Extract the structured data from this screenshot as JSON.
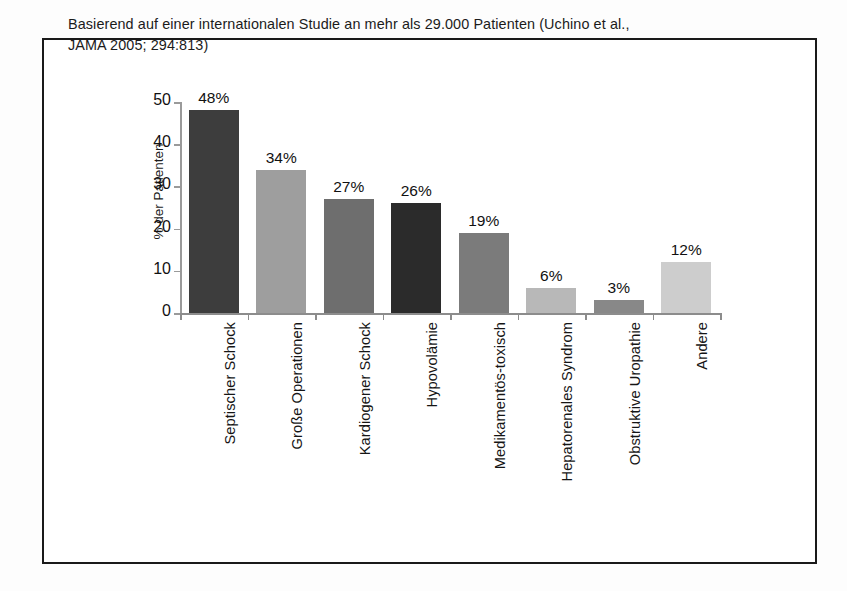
{
  "figure": {
    "title_lines": [
      "Basierend auf einer internationalen Studie an mehr als 29.000 Patienten (Uchino et al.,",
      "JAMA 2005; 294:813)"
    ],
    "border_color": "#1a1a1a",
    "background": "#ffffff"
  },
  "chart_data": {
    "type": "bar",
    "title": "Basierend auf einer internationalen Studie an mehr als 29.000 Patienten (Uchino et al., JAMA 2005; 294:813)",
    "xlabel": "",
    "ylabel": "% der Patienten",
    "ylim": [
      0,
      50
    ],
    "yticks": [
      0,
      10,
      20,
      30,
      40,
      50
    ],
    "ytick_labels": [
      "0",
      "10",
      "20",
      "30",
      "40",
      "50"
    ],
    "grid": false,
    "legend": "none",
    "value_label_suffix": "%",
    "categories": [
      "Septischer Schock",
      "Große Operationen",
      "Kardiogener Schock",
      "Hypovolämie",
      "Medikamentös-toxisch",
      "Hepatorenales Syndrom",
      "Obstruktive Uropathie",
      "Andere"
    ],
    "values": [
      48,
      34,
      27,
      26,
      19,
      6,
      3,
      12
    ],
    "value_labels": [
      "48%",
      "34%",
      "27%",
      "26%",
      "19%",
      "6%",
      "3%",
      "12%"
    ],
    "bar_colors": [
      "#3d3d3d",
      "#9e9e9e",
      "#6e6e6e",
      "#2b2b2b",
      "#7b7b7b",
      "#b8b8b8",
      "#888888",
      "#cdcdcd"
    ]
  }
}
